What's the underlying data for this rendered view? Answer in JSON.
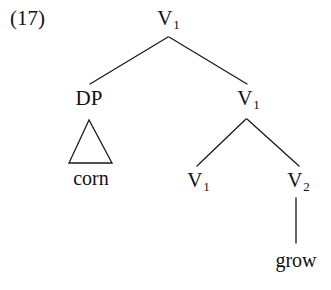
{
  "figure": {
    "example_number": "(17)",
    "background_color": "#ffffff",
    "line_color": "#1a1a1a",
    "text_color": "#111111",
    "width": 331,
    "height": 290
  },
  "tree": {
    "nodes": [
      {
        "id": "root",
        "label": "V",
        "subscript": "1",
        "x": 168,
        "y": 8,
        "type": "nonterminal"
      },
      {
        "id": "dp",
        "label": "DP",
        "subscript": "",
        "x": 89,
        "y": 88,
        "type": "nonterminal"
      },
      {
        "id": "vbar-right",
        "label": "V",
        "subscript": "1",
        "x": 248,
        "y": 88,
        "type": "nonterminal"
      },
      {
        "id": "v1-leaf",
        "label": "V",
        "subscript": "1",
        "x": 198,
        "y": 170,
        "type": "nonterminal"
      },
      {
        "id": "v2-leaf",
        "label": "V",
        "subscript": "2",
        "x": 298,
        "y": 170,
        "type": "nonterminal"
      }
    ],
    "terminals": [
      {
        "id": "corn",
        "text": "corn",
        "x": 91,
        "y": 168
      },
      {
        "id": "grow",
        "text": "grow",
        "x": 296,
        "y": 250
      }
    ],
    "branches": [
      {
        "id": "root-to-dp",
        "x1": 168,
        "y1": 37,
        "x2": 90,
        "y2": 84
      },
      {
        "id": "root-to-vbar",
        "x1": 169,
        "y1": 37,
        "x2": 247,
        "y2": 84
      },
      {
        "id": "vbar-to-v1",
        "x1": 246,
        "y1": 119,
        "x2": 197,
        "y2": 166
      },
      {
        "id": "vbar-to-v2",
        "x1": 247,
        "y1": 119,
        "x2": 299,
        "y2": 166
      },
      {
        "id": "v2-to-grow",
        "x1": 296,
        "y1": 198,
        "x2": 296,
        "y2": 243
      }
    ],
    "triangles": [
      {
        "id": "dp-triangle",
        "apex_x": 89,
        "apex_y": 120,
        "left_x": 69,
        "right_x": 112,
        "base_y": 163
      }
    ]
  }
}
